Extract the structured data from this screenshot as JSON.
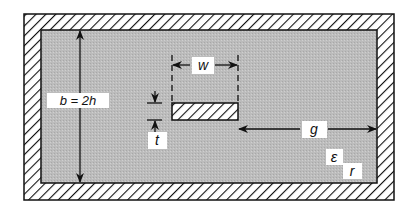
{
  "diagram": {
    "type": "stripline cross-section",
    "labels": {
      "ground_spacing": "b = 2h",
      "strip_width": "w",
      "strip_thickness": "t",
      "gap": "g",
      "permittivity_symbol": "ε",
      "permittivity_subscript": "r"
    },
    "colors": {
      "background": "#ffffff",
      "dielectric_fill": "#b9b9b9",
      "conductor_hatch": "#111111",
      "label_box": "#ffffff",
      "line": "#111111"
    }
  }
}
